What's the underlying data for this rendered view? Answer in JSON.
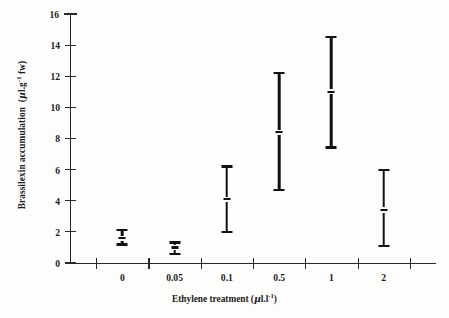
{
  "chart_data": {
    "type": "scatter",
    "title": "",
    "xlabel": "Ethylene treatment (µl.l⁻¹)",
    "ylabel": "Brassilexin accumulation  (µl.g⁻¹ fw)",
    "categories": [
      "0",
      "0.05",
      "0.1",
      "0.5",
      "1",
      "2"
    ],
    "ylim": [
      0,
      16
    ],
    "yticks": [
      0,
      2,
      4,
      6,
      8,
      10,
      12,
      14,
      16
    ],
    "grid": false,
    "legend": null,
    "marker_style": "range-bar-with-mean",
    "series": [
      {
        "name": "Brassilexin accumulation",
        "values": [
          1.6,
          1.0,
          4.1,
          8.4,
          11.0,
          3.4
        ],
        "low": [
          1.1,
          0.5,
          1.9,
          4.6,
          7.35,
          1.0
        ],
        "high": [
          2.2,
          1.4,
          6.3,
          12.3,
          14.6,
          6.05
        ]
      }
    ]
  },
  "axes": {
    "y": {
      "label_main": "Brassilexin accumulation",
      "label_units_open": "(",
      "label_units_mu": "µ",
      "label_units_rest": "l.g",
      "label_units_sup": "-1",
      "label_units_tail": " fw)",
      "ticks": [
        "16",
        "14",
        "12",
        "10",
        "8",
        "6",
        "4",
        "2",
        "0"
      ]
    },
    "x": {
      "label_main": "Ethylene treatment ",
      "label_units_open": "(",
      "label_units_mu": "µ",
      "label_units_rest": "l.l",
      "label_units_sup": "-1",
      "label_units_tail": ")",
      "ticks": [
        "0",
        "0.05",
        "0.1",
        "0.5",
        "1",
        "2"
      ]
    }
  },
  "colors": {
    "axis": "#2a2a2a",
    "marker": "#111111",
    "background": "#fdfdfc",
    "text": "#1c1c1c"
  }
}
